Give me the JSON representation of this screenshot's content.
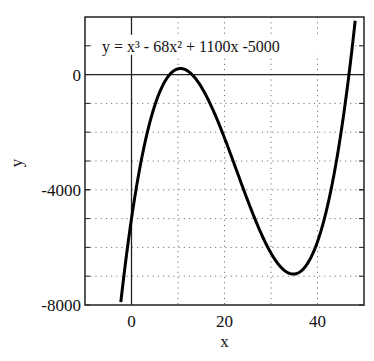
{
  "chart_data": {
    "type": "line",
    "title": "",
    "equation_label": "y = x³ - 68x² + 1100x -5000",
    "xlabel": "x",
    "ylabel": "y",
    "xlim": [
      -10,
      50
    ],
    "ylim": [
      -8000,
      2000
    ],
    "x_ticks": [
      0,
      20,
      40
    ],
    "x_tick_labels": [
      "0",
      "20",
      "40"
    ],
    "y_ticks": [
      0,
      -4000,
      -8000
    ],
    "y_tick_labels": [
      "0",
      "-4000",
      "-8000"
    ],
    "x_grid": [
      10,
      20,
      30,
      40
    ],
    "y_grid": [
      1000,
      -1000,
      -2000,
      -3000,
      -4000,
      -5000,
      -6000,
      -7000
    ],
    "grid": "dotted",
    "series": [
      {
        "name": "y = x^3 - 68x^2 + 1100x - 5000",
        "coefficients": [
          1,
          -68,
          1100,
          -5000
        ],
        "x": [
          -2.5,
          0,
          5,
          10,
          10.6,
          15,
          20,
          25,
          30,
          34.7,
          40,
          45,
          47.5
        ],
        "values": [
          -7906,
          -5000,
          -1075,
          200,
          232,
          -1225,
          -4200,
          -6375,
          -7000,
          -7300,
          -5400,
          -1625,
          1156
        ]
      }
    ],
    "reference_lines": {
      "x": 0,
      "y": 0
    }
  }
}
